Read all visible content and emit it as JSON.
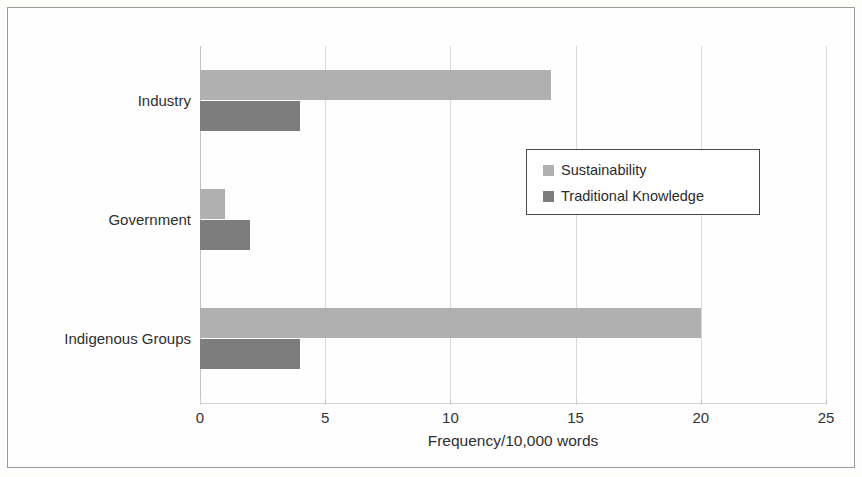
{
  "figure": {
    "background_color": "#fdfdfc",
    "frame_color": "#9a9a9a"
  },
  "chart_data": {
    "type": "bar",
    "orientation": "horizontal",
    "title": "",
    "xlabel": "Frequency/10,000 words",
    "ylabel": "",
    "categories": [
      "Industry",
      "Government",
      "Indigenous Groups"
    ],
    "series": [
      {
        "name": "Sustainability",
        "color": "#b0b0b0",
        "values": [
          14,
          1,
          20
        ]
      },
      {
        "name": "Traditional Knowledge",
        "color": "#7d7d7d",
        "values": [
          4,
          2,
          4
        ]
      }
    ],
    "xlim": [
      0,
      25
    ],
    "xticks": [
      "0",
      "5",
      "10",
      "15",
      "20",
      "25"
    ],
    "xtick_values": [
      0,
      5,
      10,
      15,
      20,
      25
    ],
    "grid": "vertical",
    "legend_position": "upper-right-inside",
    "legend_border": true
  },
  "axis": {
    "x_title": "Frequency/10,000 words",
    "tick_labels": [
      "0",
      "5",
      "10",
      "15",
      "20",
      "25"
    ]
  },
  "legend": {
    "entries": [
      {
        "label": "Sustainability",
        "color": "#b0b0b0"
      },
      {
        "label": "Traditional Knowledge",
        "color": "#7d7d7d"
      }
    ]
  },
  "categories": [
    {
      "label": "Industry"
    },
    {
      "label": "Government"
    },
    {
      "label": "Indigenous Groups"
    }
  ]
}
